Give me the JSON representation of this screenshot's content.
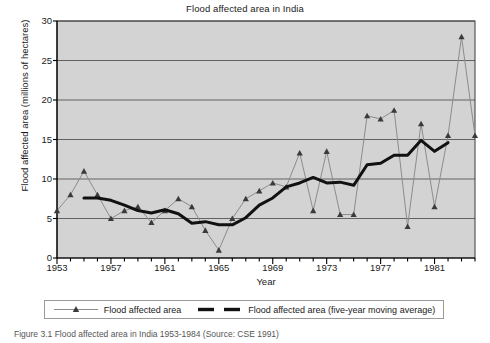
{
  "figure": {
    "caption": "Figure 3.1 Flood affected area in India 1953-1984 (Source: CSE 1991)"
  },
  "legend": {
    "series_label": "Flood affected area",
    "moving_average_label": "Flood affected area (five-year moving average)",
    "marker_icon": "triangle-marker-icon",
    "line_icon": "thick-line-icon"
  },
  "colors": {
    "plot_background": "#d3d3d3",
    "grid": "#555555",
    "axis": "#000000",
    "series_line": "#8c8c8c",
    "series_marker": "#3a3a3a",
    "moving_average_line": "#111111",
    "legend_border": "#9a9a9a",
    "page_background": "#ffffff"
  },
  "chart_data": {
    "type": "line",
    "title": "Flood affected area in India",
    "xlabel": "Year",
    "ylabel": "Flood affected area (millions of hectares)",
    "xlim": [
      1953,
      1984
    ],
    "ylim": [
      0,
      30
    ],
    "yticks": [
      0,
      5,
      10,
      15,
      20,
      25,
      30
    ],
    "xticks": [
      1953,
      1957,
      1961,
      1965,
      1969,
      1973,
      1977,
      1981
    ],
    "xtick_minor_step": 1,
    "grid": true,
    "grid_axis": "y",
    "legend_position": "below",
    "x": [
      1953,
      1954,
      1955,
      1956,
      1957,
      1958,
      1959,
      1960,
      1961,
      1962,
      1963,
      1964,
      1965,
      1966,
      1967,
      1968,
      1969,
      1970,
      1971,
      1972,
      1973,
      1974,
      1975,
      1976,
      1977,
      1978,
      1979,
      1980,
      1981,
      1982,
      1983,
      1984
    ],
    "series": [
      {
        "name": "Flood affected area",
        "marker": "triangle",
        "linewidth": 1,
        "values": [
          6.0,
          8.0,
          11.0,
          8.0,
          5.0,
          6.0,
          6.5,
          4.5,
          6.0,
          7.5,
          6.5,
          3.5,
          1.0,
          5.0,
          7.5,
          8.5,
          9.5,
          9.0,
          13.3,
          6.0,
          13.5,
          5.5,
          5.5,
          18.0,
          17.6,
          18.7,
          4.0,
          17.0,
          6.5,
          15.5,
          28.0,
          15.5
        ]
      },
      {
        "name": "Flood affected area (five-year moving average)",
        "marker": "none",
        "linewidth": 3,
        "x": [
          1955,
          1956,
          1957,
          1958,
          1959,
          1960,
          1961,
          1962,
          1963,
          1964,
          1965,
          1966,
          1967,
          1968,
          1969,
          1970,
          1971,
          1972,
          1973,
          1974,
          1975,
          1976,
          1977,
          1978,
          1979,
          1980,
          1981,
          1982
        ],
        "values": [
          7.6,
          7.6,
          7.3,
          6.7,
          6.0,
          5.7,
          6.1,
          5.6,
          4.4,
          4.6,
          4.2,
          4.2,
          5.1,
          6.7,
          7.6,
          9.0,
          9.5,
          10.2,
          9.5,
          9.6,
          9.2,
          11.8,
          12.0,
          13.0,
          13.0,
          14.9,
          13.5,
          14.6
        ]
      }
    ]
  }
}
